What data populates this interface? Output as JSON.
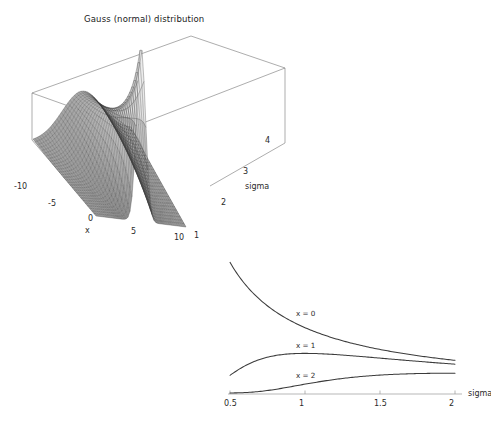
{
  "page": {
    "background": "#ffffff",
    "width": 491,
    "height": 429
  },
  "surface_plot": {
    "title": "Gauss (normal) distribution",
    "x_axis": {
      "label": "x",
      "ticks": [
        "-10",
        "-5",
        "0",
        "5",
        "10"
      ],
      "tick_values": [
        -10,
        -5,
        0,
        5,
        10
      ],
      "range": [
        -10,
        10
      ]
    },
    "sigma_axis": {
      "label": "sigma",
      "ticks": [
        "1",
        "2",
        "3",
        "4"
      ],
      "tick_values": [
        1,
        2,
        3,
        4
      ],
      "range": [
        1,
        4
      ]
    },
    "mesh_color": "#3a3a3a",
    "box_color": "#767676"
  },
  "line_plot": {
    "x_axis": {
      "label": "sigma",
      "ticks": [
        "0.5",
        "1",
        "1.5",
        "2"
      ],
      "tick_values": [
        0.5,
        1,
        1.5,
        2
      ],
      "range": [
        0.5,
        2
      ]
    },
    "curve_labels": [
      "x = 0",
      "x = 1",
      "x = 2"
    ],
    "curve_color": "#3b3b3b",
    "axis_color": "#9a9a9a"
  },
  "chart_data": [
    {
      "type": "surface",
      "title": "Gauss (normal) distribution",
      "xlabel": "x",
      "ylabel": "sigma",
      "zlabel": "",
      "xlim": [
        -10,
        10
      ],
      "ylim": [
        1,
        4
      ],
      "xticks": [
        -10,
        -5,
        0,
        5,
        10
      ],
      "yticks": [
        1,
        2,
        3,
        4
      ],
      "grid": false,
      "legend": "none",
      "function": "1/(sigma*sqrt(2*pi)) * exp(-x^2/(2*sigma^2))",
      "description": "3D wireframe mesh surface of the Gaussian probability density over x in [-10,10] and sigma in [1,4]; a sharp ridge peaks near x=0 at the smallest sigma and flattens as sigma grows.",
      "z_peak_approx": 0.4,
      "z_range": [
        0,
        0.4
      ]
    },
    {
      "type": "line",
      "title": "",
      "xlabel": "sigma",
      "ylabel": "",
      "xlim": [
        0.5,
        2.0
      ],
      "ylim": [
        0,
        0.8
      ],
      "xticks": [
        0.5,
        1,
        1.5,
        2
      ],
      "grid": false,
      "legend": "inline-labels",
      "x": [
        0.5,
        0.6,
        0.7,
        0.8,
        0.9,
        1.0,
        1.1,
        1.2,
        1.3,
        1.4,
        1.5,
        1.6,
        1.7,
        1.8,
        1.9,
        2.0
      ],
      "series": [
        {
          "name": "x = 0",
          "values": [
            0.798,
            0.665,
            0.57,
            0.499,
            0.443,
            0.399,
            0.363,
            0.332,
            0.307,
            0.285,
            0.266,
            0.249,
            0.235,
            0.222,
            0.21,
            0.199
          ]
        },
        {
          "name": "x = 1",
          "values": [
            0.108,
            0.158,
            0.198,
            0.228,
            0.25,
            0.242,
            0.236,
            0.229,
            0.221,
            0.213,
            0.204,
            0.196,
            0.188,
            0.181,
            0.174,
            0.168
          ]
        },
        {
          "name": "x = 2",
          "values": [
            0.001,
            0.005,
            0.018,
            0.044,
            0.079,
            0.108,
            0.129,
            0.144,
            0.154,
            0.16,
            0.164,
            0.166,
            0.166,
            0.165,
            0.164,
            0.162
          ]
        }
      ]
    }
  ]
}
